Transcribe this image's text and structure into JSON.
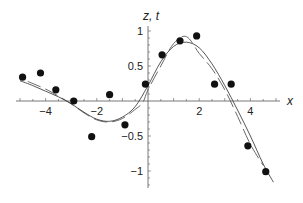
{
  "chart_data": {
    "type": "scatter",
    "title": "",
    "xlabel": "x",
    "ylabel": "z, t",
    "xlim": [
      -5.1,
      5.2
    ],
    "ylim": [
      -1.2,
      1.05
    ],
    "grid": false,
    "legend": null,
    "x_ticks": [
      -4,
      -2,
      2,
      4
    ],
    "x_tick_labels": [
      "−4",
      "−2",
      "2",
      "4"
    ],
    "y_ticks": [
      1,
      0.5,
      -0.5,
      -1
    ],
    "y_tick_labels": [
      "1",
      "0.5",
      "−0.5",
      "−1"
    ],
    "series": [
      {
        "name": "data points",
        "kind": "scatter",
        "x": [
          -4.9,
          -4.2,
          -3.6,
          -2.9,
          -2.2,
          -1.5,
          -0.9,
          -0.1,
          0.55,
          1.25,
          1.9,
          2.6,
          3.25,
          3.9,
          4.6
        ],
        "y": [
          0.34,
          0.4,
          0.16,
          0.0,
          -0.51,
          0.09,
          -0.34,
          0.24,
          0.66,
          0.86,
          0.93,
          0.24,
          0.24,
          -0.64,
          -1.01
        ]
      },
      {
        "name": "z (solid fit)",
        "kind": "line",
        "style": "solid",
        "x": [
          -5.0,
          -4.5,
          -4.0,
          -3.5,
          -3.0,
          -2.5,
          -2.0,
          -1.5,
          -1.0,
          -0.5,
          0.0,
          0.5,
          1.0,
          1.5,
          2.0,
          2.5,
          3.0,
          3.5,
          4.0,
          4.5,
          4.9
        ],
        "y": [
          0.29,
          0.22,
          0.14,
          0.06,
          -0.04,
          -0.16,
          -0.26,
          -0.29,
          -0.23,
          -0.08,
          0.22,
          0.56,
          0.78,
          0.84,
          0.76,
          0.53,
          0.22,
          -0.13,
          -0.5,
          -0.9,
          -1.16
        ]
      },
      {
        "name": "t (dashed fit)",
        "kind": "line",
        "style": "dashed",
        "x": [
          -4.7,
          -4.0,
          -3.5,
          -3.0,
          -2.5,
          -2.0,
          -1.5,
          -1.0,
          -0.5,
          -0.2,
          0.0,
          0.5,
          1.0,
          1.5,
          2.0,
          2.5,
          3.0,
          3.5,
          4.0,
          4.5
        ],
        "y": [
          0.28,
          0.17,
          0.07,
          -0.04,
          -0.17,
          -0.27,
          -0.3,
          -0.25,
          -0.12,
          -0.02,
          0.16,
          0.5,
          0.82,
          0.92,
          0.68,
          0.46,
          0.16,
          -0.22,
          -0.62,
          -0.92
        ]
      }
    ]
  }
}
